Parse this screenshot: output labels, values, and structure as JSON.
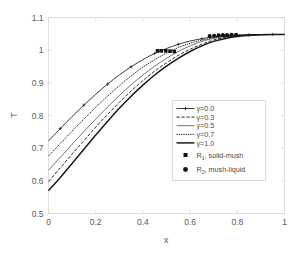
{
  "chart_data": {
    "type": "line",
    "title": "",
    "xlabel": "x",
    "ylabel": "T",
    "xlim": [
      0,
      1
    ],
    "ylim": [
      0.5,
      1.1
    ],
    "xticks": [
      "0",
      "0.2",
      "0.4",
      "0.6",
      "0.8",
      "1"
    ],
    "xtick_values": [
      0,
      0.2,
      0.4,
      0.6,
      0.8,
      1.0
    ],
    "yticks": [
      "0.5",
      "0.6",
      "0.7",
      "0.8",
      "0.9",
      "1",
      "1.1"
    ],
    "ytick_values": [
      0.5,
      0.6,
      0.7,
      0.8,
      0.9,
      1.0,
      1.1
    ],
    "grid": false,
    "legend_position": "center-right",
    "series": [
      {
        "name": "γ=0.0",
        "label": "γ=0.0",
        "style": "solid-plus",
        "x": [
          0.0,
          0.05,
          0.1,
          0.15,
          0.2,
          0.25,
          0.3,
          0.35,
          0.4,
          0.45,
          0.5,
          0.55,
          0.6,
          0.65,
          0.7,
          0.75,
          0.8,
          0.85,
          0.9,
          0.95,
          1.0
        ],
        "y": [
          0.722,
          0.76,
          0.797,
          0.832,
          0.865,
          0.896,
          0.924,
          0.949,
          0.971,
          0.99,
          1.005,
          1.018,
          1.028,
          1.035,
          1.041,
          1.044,
          1.046,
          1.047,
          1.048,
          1.048,
          1.048
        ]
      },
      {
        "name": "γ=0.3",
        "label": "γ=0.3",
        "style": "dashed",
        "x": [
          0.0,
          0.05,
          0.1,
          0.15,
          0.2,
          0.25,
          0.3,
          0.35,
          0.4,
          0.45,
          0.5,
          0.55,
          0.6,
          0.65,
          0.7,
          0.75,
          0.8,
          0.85,
          0.9,
          0.95,
          1.0
        ],
        "y": [
          0.598,
          0.64,
          0.682,
          0.723,
          0.764,
          0.803,
          0.84,
          0.875,
          0.907,
          0.936,
          0.961,
          0.984,
          1.003,
          1.018,
          1.031,
          1.039,
          1.044,
          1.046,
          1.047,
          1.048,
          1.048
        ]
      },
      {
        "name": "γ=0.5",
        "label": "γ=0.5",
        "style": "thin-solid",
        "x": [
          0.0,
          0.05,
          0.1,
          0.15,
          0.2,
          0.25,
          0.3,
          0.35,
          0.4,
          0.45,
          0.5,
          0.55,
          0.6,
          0.65,
          0.7,
          0.75,
          0.8,
          0.85,
          0.9,
          0.95,
          1.0
        ],
        "y": [
          0.632,
          0.672,
          0.712,
          0.751,
          0.789,
          0.826,
          0.861,
          0.894,
          0.924,
          0.951,
          0.975,
          0.996,
          1.013,
          1.027,
          1.036,
          1.042,
          1.045,
          1.047,
          1.047,
          1.048,
          1.048
        ]
      },
      {
        "name": "γ=0.7",
        "label": "γ=0.7",
        "style": "dotted",
        "x": [
          0.0,
          0.05,
          0.1,
          0.15,
          0.2,
          0.25,
          0.3,
          0.35,
          0.4,
          0.45,
          0.5,
          0.55,
          0.6,
          0.65,
          0.7,
          0.75,
          0.8,
          0.85,
          0.9,
          0.95,
          1.0
        ],
        "y": [
          0.676,
          0.714,
          0.752,
          0.789,
          0.825,
          0.859,
          0.891,
          0.921,
          0.948,
          0.971,
          0.991,
          1.008,
          1.021,
          1.031,
          1.038,
          1.043,
          1.046,
          1.047,
          1.048,
          1.048,
          1.048
        ]
      },
      {
        "name": "γ=1.0",
        "label": "γ=1.0",
        "style": "thick-solid",
        "x": [
          0.0,
          0.05,
          0.1,
          0.15,
          0.2,
          0.25,
          0.3,
          0.35,
          0.4,
          0.45,
          0.5,
          0.55,
          0.6,
          0.65,
          0.7,
          0.75,
          0.8,
          0.85,
          0.9,
          0.95,
          1.0
        ],
        "y": [
          0.57,
          0.61,
          0.653,
          0.697,
          0.74,
          0.782,
          0.822,
          0.859,
          0.893,
          0.924,
          0.951,
          0.975,
          0.996,
          1.013,
          1.027,
          1.036,
          1.042,
          1.045,
          1.047,
          1.048,
          1.048
        ]
      }
    ],
    "markers": [
      {
        "name": "R1",
        "label": "R",
        "subscript": "1",
        "description": ", solid-mush",
        "shape": "square",
        "points": [
          {
            "x": 0.462,
            "y": 0.998
          },
          {
            "x": 0.478,
            "y": 0.998
          },
          {
            "x": 0.497,
            "y": 0.998
          },
          {
            "x": 0.515,
            "y": 0.997
          },
          {
            "x": 0.533,
            "y": 0.996
          }
        ]
      },
      {
        "name": "R2",
        "label": "R",
        "subscript": "2",
        "description": ", mush-liquid",
        "shape": "circle",
        "points": [
          {
            "x": 0.683,
            "y": 1.043
          },
          {
            "x": 0.702,
            "y": 1.044
          },
          {
            "x": 0.721,
            "y": 1.045
          },
          {
            "x": 0.739,
            "y": 1.046
          },
          {
            "x": 0.757,
            "y": 1.046
          },
          {
            "x": 0.776,
            "y": 1.047
          },
          {
            "x": 0.795,
            "y": 1.047
          }
        ]
      }
    ]
  },
  "legend": {
    "entries": [
      {
        "label": "γ=0.0",
        "style": "solid-plus"
      },
      {
        "label": "γ=0.3",
        "style": "dashed"
      },
      {
        "label": "γ=0.5",
        "style": "thin-solid"
      },
      {
        "label": "γ=0.7",
        "style": "dotted"
      },
      {
        "label": "γ=1.0",
        "style": "thick-solid"
      }
    ],
    "marker_entries": [
      {
        "base": "R",
        "sub": "1",
        "rest": ", solid-mush",
        "shape": "square"
      },
      {
        "base": "R",
        "sub": "2",
        "rest": ", mush-liquid",
        "shape": "circle"
      }
    ]
  },
  "colors": {
    "curve": "#1a1a1a",
    "frame": "#d8d8d8",
    "text": "#5a5a5a",
    "background": "#ffffff"
  }
}
